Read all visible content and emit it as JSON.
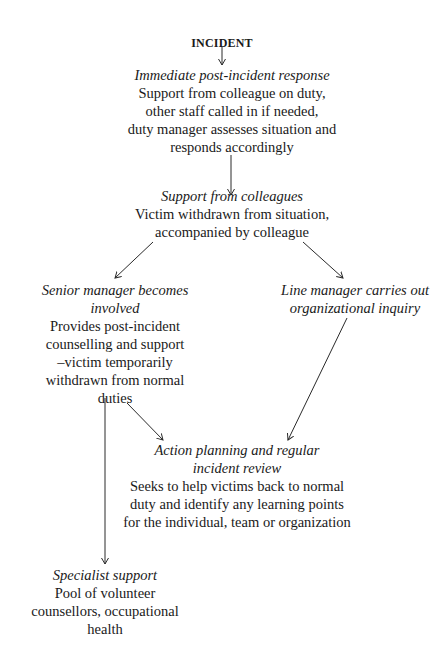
{
  "diagram": {
    "type": "flowchart",
    "root": {
      "label": "INCIDENT"
    },
    "nodes": {
      "immediate": {
        "title": "Immediate post-incident response",
        "lines": [
          "Support from colleague on duty,",
          "other staff called in if needed,",
          "duty manager assesses situation and",
          "responds accordingly"
        ]
      },
      "colleagues": {
        "title": "Support from colleagues",
        "lines": [
          "Victim withdrawn from situation,",
          "accompanied by colleague"
        ]
      },
      "senior": {
        "title_lines": [
          "Senior manager becomes",
          "involved"
        ],
        "lines": [
          "Provides post-incident",
          "counselling and support",
          "–victim temporarily",
          "withdrawn from normal",
          "duties"
        ]
      },
      "line_manager": {
        "title_lines": [
          "Line manager carries out",
          "organizational inquiry"
        ]
      },
      "action": {
        "title_lines": [
          "Action planning and regular",
          "incident review"
        ],
        "lines": [
          "Seeks to help victims back to normal",
          "duty and identify any learning points",
          "for the individual, team or organization"
        ]
      },
      "specialist": {
        "title": "Specialist support",
        "lines": [
          "Pool of volunteer",
          "counsellors, occupational",
          "health"
        ]
      }
    },
    "edges": [
      {
        "from": "INCIDENT",
        "to": "Immediate post-incident response"
      },
      {
        "from": "Immediate post-incident response",
        "to": "Support from colleagues"
      },
      {
        "from": "Support from colleagues",
        "to": "Senior manager becomes involved"
      },
      {
        "from": "Support from colleagues",
        "to": "Line manager carries out organizational inquiry"
      },
      {
        "from": "Senior manager becomes involved",
        "to": "Action planning and regular incident review"
      },
      {
        "from": "Line manager carries out organizational inquiry",
        "to": "Action planning and regular incident review"
      },
      {
        "from": "Senior manager becomes involved",
        "to": "Specialist support"
      }
    ],
    "colors": {
      "text": "#1a1a1a",
      "line": "#2a2a2a",
      "background": "#ffffff"
    }
  }
}
